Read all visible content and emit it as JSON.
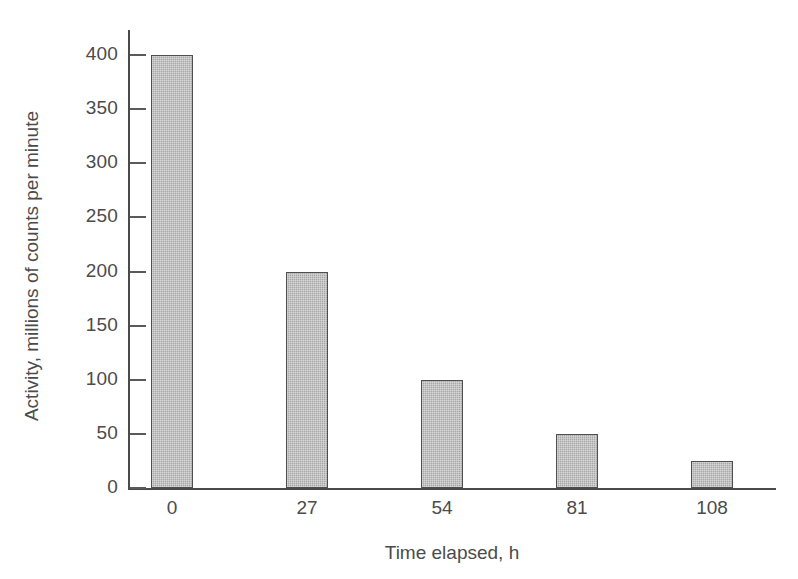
{
  "chart_data": {
    "type": "bar",
    "title": "",
    "subtitle": "",
    "xlabel": "Time elapsed, h",
    "ylabel": "Activity, millions of counts per minute",
    "categories": [
      "0",
      "27",
      "54",
      "81",
      "108"
    ],
    "x": [
      0,
      27,
      54,
      81,
      108
    ],
    "values": [
      400,
      200,
      100,
      50,
      25
    ],
    "series": [
      {
        "name": "Activity",
        "values": [
          400,
          200,
          100,
          50,
          25
        ]
      }
    ],
    "ylim": [
      0,
      400
    ],
    "y_ticks": [
      0,
      50,
      100,
      150,
      200,
      250,
      300,
      350,
      400
    ],
    "y_tick_labels": [
      "0",
      "50",
      "100",
      "150",
      "200",
      "250",
      "300",
      "350",
      "400"
    ],
    "x_tick_labels": [
      "0",
      "27",
      "54",
      "81",
      "108"
    ],
    "grid": false,
    "legend": null,
    "legend_position": "none",
    "annotations": [],
    "bar_fill_color": "#a9a9a9",
    "bar_edge_color": "#4f4f4f",
    "axis_color": "#4a4a4a",
    "text_color": "#4b4b4b",
    "background_color": "#ffffff"
  },
  "axes": {
    "y_title": "Activity, millions of counts per minute",
    "x_title": "Time elapsed, h"
  }
}
